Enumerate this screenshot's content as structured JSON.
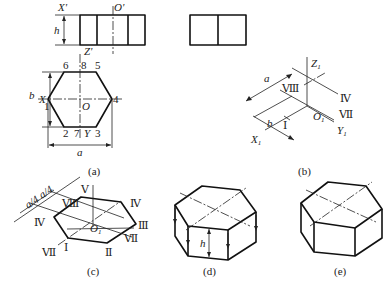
{
  "figure": {
    "panels": {
      "a": {
        "caption": "(a)",
        "front_view": {
          "labels": {
            "x": "X'",
            "o": "O'",
            "z": "Z'",
            "h": "h"
          }
        },
        "top_view": {
          "labels": {
            "x": "X",
            "o": "O",
            "y": "Y",
            "a": "a",
            "b": "b"
          },
          "vertices": [
            "1",
            "2",
            "3",
            "4",
            "5",
            "6"
          ],
          "midpoints": [
            "7",
            "8"
          ]
        }
      },
      "b": {
        "caption": "(b)",
        "labels": {
          "z": "Z",
          "x": "X",
          "y": "Y",
          "o": "O",
          "a": "a",
          "b": "b",
          "sub": "1"
        },
        "points": [
          "Ⅷ",
          "Ⅳ",
          "Ⅶ",
          "Ⅰ"
        ]
      },
      "c": {
        "caption": "(c)",
        "dims": [
          "a/4",
          "a/4"
        ],
        "labels": {
          "o": "O",
          "sub": "1"
        },
        "points": [
          "Ⅴ",
          "Ⅷ",
          "Ⅳ",
          "Ⅳ",
          "Ⅲ",
          "Ⅶ",
          "Ⅱ",
          "Ⅰ",
          "Ⅶ"
        ]
      },
      "d": {
        "caption": "(d)",
        "labels": {
          "h": "h"
        }
      },
      "e": {
        "caption": "(e)"
      }
    }
  }
}
